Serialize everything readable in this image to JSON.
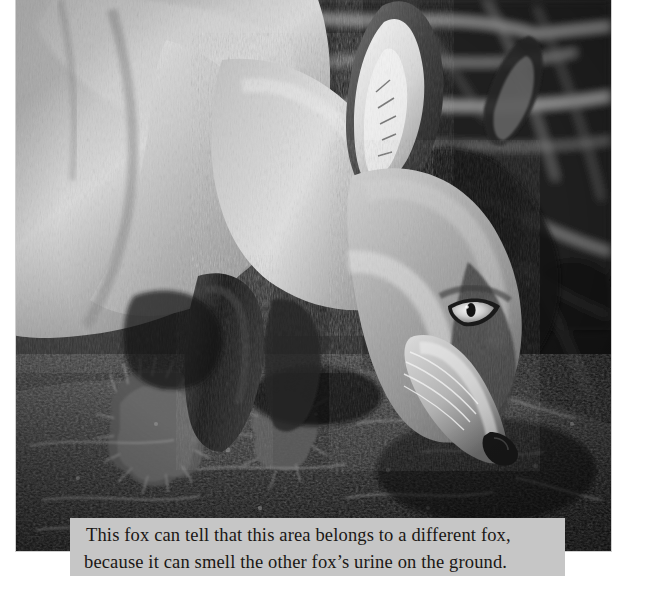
{
  "page": {
    "type": "photograph-with-caption",
    "background_color": "#ffffff",
    "width": 646,
    "height": 599
  },
  "photo": {
    "name": "fox-sniffing-ground-photo",
    "subject": "red fox sniffing the ground",
    "rendering": "black-and-white",
    "alt_text": "A black and white photograph of a fox with its head lowered, sniffing mossy dark ground, with blurred twigs in the background.",
    "frame": {
      "left": 16,
      "top": 0,
      "width": 595,
      "height": 551,
      "border_color": "#cfcfcf"
    },
    "tones": {
      "darkest": "#0d0d0d",
      "dark": "#2a2a2a",
      "mid": "#767676",
      "light": "#c2c2c2",
      "lightest": "#f2f2f2"
    },
    "regions": [
      {
        "name": "fox-body-fur",
        "description": "pale grey flank and shoulder fur filling the left half of the frame"
      },
      {
        "name": "fox-foreleg",
        "description": "dark foreleg descending toward the ground at centre-left"
      },
      {
        "name": "fox-head",
        "description": "head lowered to the right, muzzle almost touching the soil"
      },
      {
        "name": "fox-ear",
        "description": "upright ear with pale inner fur, upper centre of the frame"
      },
      {
        "name": "fox-eye",
        "description": "bright amber-toned eye rendered as a light almond shape"
      },
      {
        "name": "background-twigs",
        "description": "blurred pale twigs and stems across the dark upper right background"
      },
      {
        "name": "ground-moss",
        "description": "dark mossy soil occupying the lower third of the frame"
      }
    ]
  },
  "caption": {
    "name": "photo-caption",
    "background_color": "#c6c6c6",
    "text_color": "#1a1714",
    "line1": "This fox can tell that this area belongs to a different fox,",
    "line2": "because it can smell the other fox’s urine on the ground.",
    "full_text": "This fox can tell that this area belongs to a different fox, because it can smell the other fox’s urine on the ground."
  }
}
